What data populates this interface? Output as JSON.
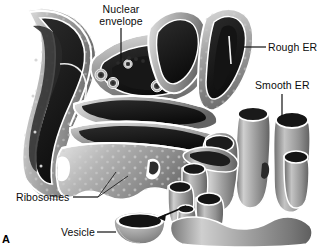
{
  "figure": {
    "panel_letter": "A",
    "background_color": "#ffffff",
    "text_color": "#0b0b0b",
    "width": 319,
    "height": 249
  },
  "labels": {
    "nuclear_envelope": "Nuclear\nenvelope",
    "rough_er": "Rough ER",
    "smooth_er": "Smooth ER",
    "ribosomes": "Ribosomes",
    "vesicle": "Vesicle"
  },
  "palette": {
    "membrane_light": "#d8d8d8",
    "membrane_mid": "#9a9a9a",
    "membrane_dark": "#6a6a6a",
    "lumen_dark": "#1d1d1d",
    "lumen_black": "#101010",
    "rim_highlight": "#ffffff",
    "ribosome_dot": "#c9c9c9",
    "leader_line": "#111111"
  },
  "structures": [
    {
      "name": "rough-er-cisternae",
      "description": "stacked curved membrane sheets studded with ribosomes"
    },
    {
      "name": "nuclear-envelope",
      "description": "folded double membrane with nuclear pores"
    },
    {
      "name": "nuclear-pores",
      "count": 5
    },
    {
      "name": "smooth-er-tubules",
      "description": "network of smooth branching tubules with open cut ends"
    },
    {
      "name": "transport-vesicle",
      "description": "cup shaped vesicle budding from smooth ER"
    },
    {
      "name": "budding-arrow",
      "description": "curved arrow from smooth ER toward vesicle"
    }
  ]
}
